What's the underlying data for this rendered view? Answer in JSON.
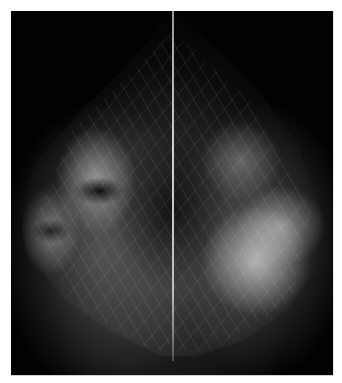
{
  "image": {
    "description": "Side-by-side mirrored mammogram views on black background separated by a vertical line",
    "background_color": "#000000",
    "page_color": "#ffffff",
    "divider_color": "#c8c8c8"
  }
}
